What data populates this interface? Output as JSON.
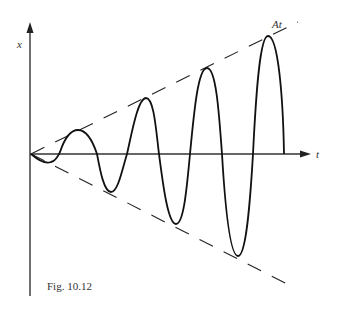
{
  "figure": {
    "caption": "Fig. 10.12",
    "y_axis_label": "x",
    "x_axis_label": "t",
    "envelope_label": "At"
  },
  "colors": {
    "line": "#111111",
    "axis": "#333333",
    "background": "#ffffff"
  }
}
